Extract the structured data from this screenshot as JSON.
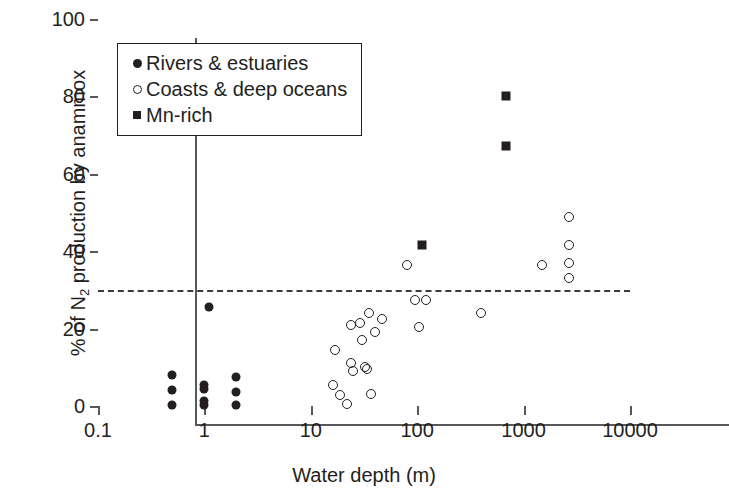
{
  "chart_data": {
    "type": "scatter",
    "title": "",
    "xlabel": "Water depth (m)",
    "ylabel_prefix": "% of N",
    "ylabel_sub": "2",
    "ylabel_suffix": " production by anammox",
    "xscale": "log",
    "xlim": [
      0.1,
      10000
    ],
    "ylim": [
      0,
      100
    ],
    "xticks": [
      0.1,
      1,
      10,
      100,
      1000,
      10000
    ],
    "xtick_labels": [
      "0.1",
      "1",
      "10",
      "100",
      "1000",
      "10000"
    ],
    "yticks": [
      0,
      20,
      40,
      60,
      80,
      100
    ],
    "ytick_labels": [
      "0",
      "20",
      "40",
      "60",
      "80",
      "100"
    ],
    "grid": false,
    "legend_position": "upper-left inside",
    "annotations": [
      {
        "name": "threshold-line",
        "type": "hline",
        "y": 30,
        "style": "dashed",
        "label": ""
      }
    ],
    "series": [
      {
        "name": "Rivers & estuaries",
        "marker": "filled-circle",
        "color": "#231f20",
        "points": [
          {
            "x": 0.5,
            "y": 0.3
          },
          {
            "x": 0.5,
            "y": 4.2
          },
          {
            "x": 0.5,
            "y": 8.0
          },
          {
            "x": 1.0,
            "y": 0.3
          },
          {
            "x": 1.0,
            "y": 1.3
          },
          {
            "x": 1.0,
            "y": 4.3
          },
          {
            "x": 1.0,
            "y": 5.3
          },
          {
            "x": 1.1,
            "y": 25.5
          },
          {
            "x": 2.0,
            "y": 0.3
          },
          {
            "x": 2.0,
            "y": 3.6
          },
          {
            "x": 2.0,
            "y": 7.5
          }
        ]
      },
      {
        "name": "Coasts & deep oceans",
        "marker": "open-circle",
        "color": "#231f20",
        "points": [
          {
            "x": 16,
            "y": 5.5
          },
          {
            "x": 17,
            "y": 14.5
          },
          {
            "x": 19,
            "y": 2.8
          },
          {
            "x": 22,
            "y": 0.5
          },
          {
            "x": 24,
            "y": 21.0
          },
          {
            "x": 24,
            "y": 11.0
          },
          {
            "x": 25,
            "y": 9.0
          },
          {
            "x": 29,
            "y": 21.5
          },
          {
            "x": 30,
            "y": 17.0
          },
          {
            "x": 32,
            "y": 10.0
          },
          {
            "x": 34,
            "y": 9.5
          },
          {
            "x": 35,
            "y": 24.0
          },
          {
            "x": 37,
            "y": 3.2
          },
          {
            "x": 40,
            "y": 19.0
          },
          {
            "x": 47,
            "y": 22.5
          },
          {
            "x": 80,
            "y": 36.5
          },
          {
            "x": 95,
            "y": 27.5
          },
          {
            "x": 105,
            "y": 20.5
          },
          {
            "x": 120,
            "y": 27.5
          },
          {
            "x": 400,
            "y": 24.0
          },
          {
            "x": 1500,
            "y": 36.5
          },
          {
            "x": 2700,
            "y": 48.8
          },
          {
            "x": 2700,
            "y": 41.5
          },
          {
            "x": 2700,
            "y": 37.0
          },
          {
            "x": 2700,
            "y": 33.0
          }
        ]
      },
      {
        "name": "Mn-rich",
        "marker": "filled-square",
        "color": "#231f20",
        "points": [
          {
            "x": 110,
            "y": 41.5
          },
          {
            "x": 680,
            "y": 80.0
          },
          {
            "x": 680,
            "y": 67.3
          }
        ]
      }
    ]
  },
  "legend": {
    "items": [
      {
        "label": "Rivers & estuaries",
        "marker": "filled-circle"
      },
      {
        "label": "Coasts & deep oceans",
        "marker": "open-circle"
      },
      {
        "label": "Mn-rich",
        "marker": "filled-square"
      }
    ]
  }
}
